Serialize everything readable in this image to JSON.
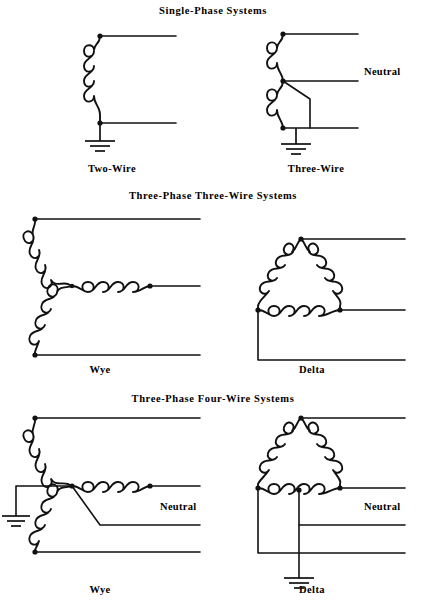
{
  "page": {
    "background_color": "#ffffff",
    "ink_color": "#111111",
    "width": 426,
    "height": 615
  },
  "sections": [
    {
      "id": "single-phase",
      "title": "Single-Phase  Systems",
      "title_y": 10,
      "diagrams": [
        {
          "id": "two-wire",
          "caption": "Two-Wire",
          "caption_x": 112,
          "caption_y": 168
        },
        {
          "id": "three-wire",
          "caption": "Three-Wire",
          "caption_x": 316,
          "caption_y": 168
        }
      ]
    },
    {
      "id": "three-phase-three-wire",
      "title": "Three-Phase  Three-Wire  Systems",
      "title_y": 195,
      "diagrams": [
        {
          "id": "wye-3w",
          "caption": "Wye",
          "caption_x": 100,
          "caption_y": 369
        },
        {
          "id": "delta-3w",
          "caption": "Delta",
          "caption_x": 312,
          "caption_y": 369
        }
      ]
    },
    {
      "id": "three-phase-four-wire",
      "title": "Three-Phase  Four-Wire  Systems",
      "title_y": 398,
      "diagrams": [
        {
          "id": "wye-4w",
          "caption": "Wye",
          "caption_x": 100,
          "caption_y": 589
        },
        {
          "id": "delta-4w",
          "caption": "Delta",
          "caption_x": 312,
          "caption_y": 589
        }
      ]
    }
  ],
  "labels": {
    "neutral_single_phase": {
      "text": "Neutral",
      "x": 364,
      "y": 73
    },
    "neutral_wye_4w": {
      "text": "Neutral",
      "x": 160,
      "y": 508
    },
    "neutral_delta_4w": {
      "text": "Neutral",
      "x": 364,
      "y": 508
    }
  },
  "symbols": {
    "winding": "transformer-coil",
    "ground": "earth-ground",
    "terminal": "junction-dot"
  },
  "notes": {
    "line_style": "solid black lines",
    "coil_turns_vertical": 4,
    "coil_turns_horizontal": 5
  }
}
